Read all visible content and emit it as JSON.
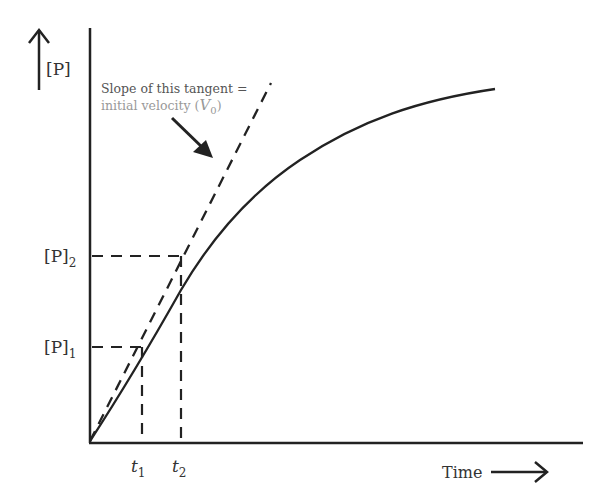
{
  "diagram": {
    "type": "enzyme-kinetics-progress-curve",
    "y_axis": {
      "label": "[P]",
      "arrow": "up-arrow"
    },
    "x_axis": {
      "label": "Time",
      "arrow": "right-arrow"
    },
    "y_ticks": [
      {
        "base": "[P]",
        "sub": "1"
      },
      {
        "base": "[P]",
        "sub": "2"
      }
    ],
    "x_ticks": [
      {
        "base": "t",
        "sub": "1"
      },
      {
        "base": "t",
        "sub": "2"
      }
    ],
    "annotation": {
      "line1": "Slope of this tangent =",
      "line2_prefix": "initial velocity (",
      "symbol": "V",
      "symbol_sub": "0",
      "line2_suffix": ")"
    },
    "colors": {
      "line": "#222222",
      "annotation_line1": "#555555",
      "annotation_line2": "#999999"
    }
  }
}
